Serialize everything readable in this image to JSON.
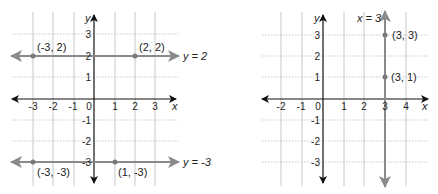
{
  "colors": {
    "axis": "#111111",
    "grid": "#c8c8c8",
    "highlight_line": "#8a8a8a",
    "point": "#7a7a7a",
    "text": "#222222"
  },
  "graphs": [
    {
      "id": "left",
      "x_axis_label": "x",
      "y_axis_label": "y",
      "x_ticks": [
        "-3",
        "-2",
        "-1",
        "0",
        "1",
        "2",
        "3"
      ],
      "y_ticks": [
        "3",
        "2",
        "1",
        "-1",
        "-2",
        "-3"
      ],
      "lines": [
        {
          "equation": "y = 2",
          "orientation": "horizontal",
          "value": 2
        },
        {
          "equation": "y = -3",
          "orientation": "horizontal",
          "value": -3
        }
      ],
      "points": [
        {
          "label": "(-3, 2)",
          "x": -3,
          "y": 2
        },
        {
          "label": "(2, 2)",
          "x": 2,
          "y": 2
        },
        {
          "label": "(-3, -3)",
          "x": -3,
          "y": -3
        },
        {
          "label": "(1, -3)",
          "x": 1,
          "y": -3
        }
      ]
    },
    {
      "id": "right",
      "x_axis_label": "x",
      "y_axis_label": "y",
      "x_ticks": [
        "-2",
        "-1",
        "0",
        "1",
        "2",
        "3",
        "4"
      ],
      "y_ticks": [
        "3",
        "2",
        "1",
        "-1",
        "-2",
        "-3"
      ],
      "lines": [
        {
          "equation": "x = 3",
          "orientation": "vertical",
          "value": 3
        }
      ],
      "points": [
        {
          "label": "(3, 3)",
          "x": 3,
          "y": 3
        },
        {
          "label": "(3, 1)",
          "x": 3,
          "y": 1
        }
      ]
    }
  ]
}
